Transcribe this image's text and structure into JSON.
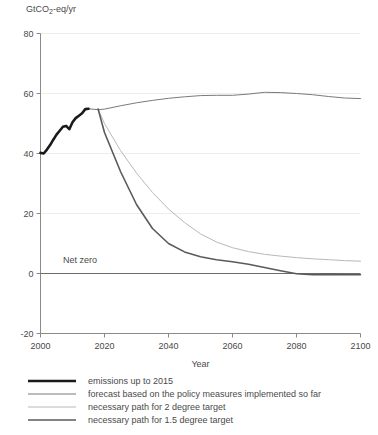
{
  "chart_data": {
    "type": "line",
    "title": "",
    "xlabel": "Year",
    "ylabel": "GtCO2-eq/yr",
    "ylabel_parts": {
      "pre": "GtCO",
      "sub": "2",
      "post": "-eq/yr"
    },
    "xlim": [
      2000,
      2100
    ],
    "ylim": [
      -20,
      80
    ],
    "xticks": [
      2000,
      2020,
      2040,
      2060,
      2080,
      2100
    ],
    "yticks": [
      80,
      60,
      40,
      20,
      0,
      -20
    ],
    "grid": true,
    "grid_axis": "y",
    "legend_position": "below-plot",
    "annotations": [
      {
        "text": "Net zero",
        "x": 2007,
        "y": 3.5
      }
    ],
    "zero_line": 0,
    "series": [
      {
        "name": "emissions up to 2015",
        "color": "#1a1a1a",
        "width": 2.6,
        "x": [
          2000,
          2001,
          2002,
          2003,
          2004,
          2005,
          2006,
          2007,
          2008,
          2009,
          2010,
          2011,
          2012,
          2013,
          2014,
          2015
        ],
        "values": [
          40.2,
          40.0,
          41.3,
          42.8,
          44.6,
          46.3,
          47.6,
          48.9,
          49.2,
          48.1,
          50.4,
          51.8,
          52.6,
          53.4,
          54.8,
          54.9
        ]
      },
      {
        "name": "forecast based on the policy measures implemented so far",
        "color": "#6b6b6b",
        "width": 0.9,
        "x": [
          2015,
          2018,
          2020,
          2025,
          2030,
          2035,
          2040,
          2045,
          2050,
          2055,
          2060,
          2065,
          2070,
          2075,
          2080,
          2085,
          2090,
          2095,
          2100
        ],
        "values": [
          54.9,
          54.6,
          54.8,
          55.9,
          56.9,
          57.7,
          58.4,
          58.9,
          59.3,
          59.4,
          59.4,
          59.8,
          60.4,
          60.3,
          60.0,
          59.6,
          59.0,
          58.5,
          58.3
        ]
      },
      {
        "name": "necessary path for 2 degree target",
        "color": "#b8b8b8",
        "width": 1.0,
        "x": [
          2018,
          2020,
          2025,
          2030,
          2035,
          2040,
          2045,
          2050,
          2055,
          2060,
          2065,
          2070,
          2075,
          2080,
          2085,
          2090,
          2095,
          2100
        ],
        "values": [
          54.8,
          50.0,
          41.0,
          33.5,
          27.0,
          21.5,
          17.0,
          13.2,
          10.5,
          8.6,
          7.3,
          6.4,
          5.8,
          5.3,
          4.9,
          4.6,
          4.3,
          4.1
        ]
      },
      {
        "name": "necessary path for 1.5 degree target",
        "color": "#5a5a5a",
        "width": 1.6,
        "x": [
          2018,
          2020,
          2025,
          2030,
          2035,
          2040,
          2045,
          2050,
          2055,
          2060,
          2065,
          2070,
          2075,
          2080,
          2085,
          2090,
          2095,
          2100
        ],
        "values": [
          54.8,
          47.0,
          34.0,
          23.0,
          15.0,
          10.0,
          7.2,
          5.6,
          4.6,
          3.9,
          3.1,
          2.0,
          0.9,
          -0.1,
          -0.4,
          -0.3,
          -0.4,
          -0.4
        ]
      }
    ]
  },
  "legend": {
    "items": [
      {
        "label": "emissions up to 2015"
      },
      {
        "label": "forecast based on the policy measures implemented so far"
      },
      {
        "label": "necessary path for 2 degree target"
      },
      {
        "label": "necessary path for 1.5 degree target"
      }
    ]
  }
}
